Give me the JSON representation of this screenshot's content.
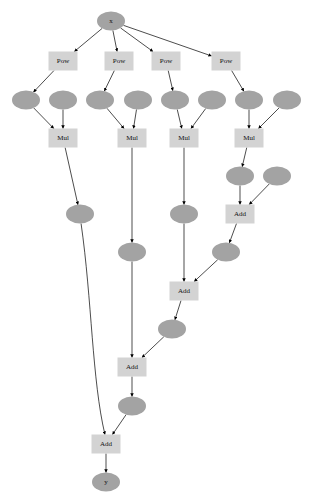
{
  "graph": {
    "width": 314,
    "height": 501,
    "colors": {
      "variable_fill": "#a3a3a3",
      "operation_fill": "#d3d3d3",
      "edge": "#000000"
    },
    "nodes": [
      {
        "id": "x",
        "type": "variable",
        "label": "x",
        "cx": 111,
        "cy": 21
      },
      {
        "id": "pow1",
        "type": "operation",
        "label": "Pow",
        "cx": 63,
        "cy": 61
      },
      {
        "id": "pow2",
        "type": "operation",
        "label": "Pow",
        "cx": 119,
        "cy": 61
      },
      {
        "id": "pow3",
        "type": "operation",
        "label": "Pow",
        "cx": 166,
        "cy": 61
      },
      {
        "id": "pow4",
        "type": "operation",
        "label": "Pow",
        "cx": 226,
        "cy": 61
      },
      {
        "id": "v1",
        "type": "variable",
        "label": "",
        "cx": 26,
        "cy": 100
      },
      {
        "id": "v2",
        "type": "variable",
        "label": "",
        "cx": 63,
        "cy": 100
      },
      {
        "id": "v3",
        "type": "variable",
        "label": "",
        "cx": 100,
        "cy": 100
      },
      {
        "id": "v4",
        "type": "variable",
        "label": "",
        "cx": 138,
        "cy": 100
      },
      {
        "id": "v5",
        "type": "variable",
        "label": "",
        "cx": 175,
        "cy": 100
      },
      {
        "id": "v6",
        "type": "variable",
        "label": "",
        "cx": 212,
        "cy": 100
      },
      {
        "id": "v7",
        "type": "variable",
        "label": "",
        "cx": 249,
        "cy": 100
      },
      {
        "id": "v8",
        "type": "variable",
        "label": "",
        "cx": 287,
        "cy": 100
      },
      {
        "id": "mul1",
        "type": "operation",
        "label": "Mul",
        "cx": 63,
        "cy": 138
      },
      {
        "id": "mul2",
        "type": "operation",
        "label": "Mul",
        "cx": 132,
        "cy": 138
      },
      {
        "id": "mul3",
        "type": "operation",
        "label": "Mul",
        "cx": 184,
        "cy": 138
      },
      {
        "id": "mul4",
        "type": "operation",
        "label": "Mul",
        "cx": 249,
        "cy": 138
      },
      {
        "id": "v9",
        "type": "variable",
        "label": "",
        "cx": 240,
        "cy": 176
      },
      {
        "id": "v10",
        "type": "variable",
        "label": "",
        "cx": 277,
        "cy": 176
      },
      {
        "id": "v11",
        "type": "variable",
        "label": "",
        "cx": 80,
        "cy": 214
      },
      {
        "id": "v12",
        "type": "variable",
        "label": "",
        "cx": 184,
        "cy": 214
      },
      {
        "id": "add1",
        "type": "operation",
        "label": "Add",
        "cx": 240,
        "cy": 214
      },
      {
        "id": "v13",
        "type": "variable",
        "label": "",
        "cx": 132,
        "cy": 252
      },
      {
        "id": "v14",
        "type": "variable",
        "label": "",
        "cx": 226,
        "cy": 252
      },
      {
        "id": "add2",
        "type": "operation",
        "label": "Add",
        "cx": 184,
        "cy": 291
      },
      {
        "id": "v15",
        "type": "variable",
        "label": "",
        "cx": 172,
        "cy": 329
      },
      {
        "id": "add3",
        "type": "operation",
        "label": "Add",
        "cx": 132,
        "cy": 367
      },
      {
        "id": "v16",
        "type": "variable",
        "label": "",
        "cx": 132,
        "cy": 406
      },
      {
        "id": "add4",
        "type": "operation",
        "label": "Add",
        "cx": 106,
        "cy": 444
      },
      {
        "id": "y",
        "type": "variable",
        "label": "y",
        "cx": 106,
        "cy": 482
      }
    ],
    "edges": [
      [
        "x",
        "pow1"
      ],
      [
        "x",
        "pow2"
      ],
      [
        "x",
        "pow3"
      ],
      [
        "x",
        "pow4"
      ],
      [
        "pow1",
        "v1"
      ],
      [
        "pow2",
        "v3"
      ],
      [
        "pow3",
        "v5"
      ],
      [
        "pow4",
        "v7"
      ],
      [
        "v1",
        "mul1"
      ],
      [
        "v2",
        "mul1"
      ],
      [
        "v3",
        "mul2"
      ],
      [
        "v4",
        "mul2"
      ],
      [
        "v5",
        "mul3"
      ],
      [
        "v6",
        "mul3"
      ],
      [
        "v7",
        "mul4"
      ],
      [
        "v8",
        "mul4"
      ],
      [
        "mul1",
        "v11"
      ],
      [
        "mul2",
        "v13"
      ],
      [
        "mul3",
        "v12"
      ],
      [
        "mul4",
        "v9"
      ],
      [
        "v9",
        "add1"
      ],
      [
        "v10",
        "add1"
      ],
      [
        "add1",
        "v14"
      ],
      [
        "v12",
        "add2"
      ],
      [
        "v14",
        "add2"
      ],
      [
        "add2",
        "v15"
      ],
      [
        "v13",
        "add3"
      ],
      [
        "v15",
        "add3"
      ],
      [
        "add3",
        "v16"
      ],
      [
        "v11",
        "add4"
      ],
      [
        "v16",
        "add4"
      ],
      [
        "add4",
        "y"
      ]
    ]
  }
}
